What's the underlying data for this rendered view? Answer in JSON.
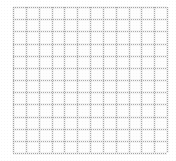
{
  "image": {
    "kind": "grid-pattern",
    "description": "Faint light-gray graph-paper grid on a white background",
    "width": 176,
    "height": 161
  },
  "colors": {
    "background": "#ffffff",
    "paper": "#fdfdfd",
    "grid_line": "#969696",
    "grid_halo": "#aaaaaa"
  },
  "grid": {
    "columns": 12,
    "rows": 12,
    "cell_width": 12.8,
    "cell_height": 12.2,
    "origin_x": 13,
    "origin_y": 7,
    "extent_x": 167,
    "extent_y": 153,
    "line_width": 1,
    "line_style": "dotted",
    "vertical_line_positions": [
      13,
      25.8,
      38.7,
      51.5,
      64.3,
      77.2,
      90.0,
      102.8,
      115.7,
      128.5,
      141.3,
      154.2,
      167
    ],
    "horizontal_line_positions": [
      7,
      19.2,
      31.3,
      43.5,
      55.7,
      67.8,
      80.0,
      92.2,
      104.3,
      116.5,
      128.7,
      140.8,
      153
    ]
  },
  "margins": {
    "left": 13,
    "top": 7,
    "right": 9,
    "bottom": 8
  },
  "labels": {
    "title": "",
    "caption": ""
  }
}
